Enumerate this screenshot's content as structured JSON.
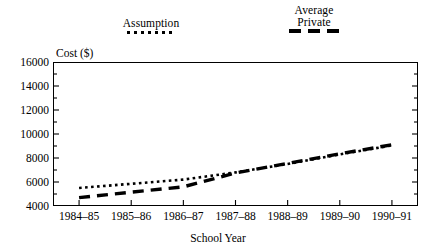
{
  "chart_data": {
    "type": "line",
    "title": "",
    "xlabel": "School Year",
    "ylabel": "Cost ($)",
    "categories": [
      "1984–85",
      "1985–86",
      "1986–87",
      "1987–88",
      "1988–89",
      "1989–90",
      "1990–91"
    ],
    "ylim": [
      4000,
      16000
    ],
    "ytick_labels": [
      "4000",
      "6000",
      "8000",
      "10000",
      "12000",
      "14000",
      "16000"
    ],
    "ytick_values": [
      4000,
      6000,
      8000,
      10000,
      12000,
      14000,
      16000
    ],
    "yminor_step": 1000,
    "grid": false,
    "legend_position": "above-plot",
    "series": [
      {
        "name": "Assumption",
        "style": "dotted",
        "values": [
          5500,
          5850,
          6200,
          6800,
          7500,
          8300,
          9050
        ]
      },
      {
        "name": "Average\nPrivate",
        "style": "dashed",
        "values": [
          4700,
          5150,
          5600,
          6750,
          7550,
          8350,
          9100
        ]
      }
    ]
  },
  "legend": {
    "assumption": {
      "label": "Assumption",
      "swatch": "dotted-line-swatch"
    },
    "average_private": {
      "label": "Average\nPrivate",
      "swatch": "dashed-line-swatch"
    }
  },
  "axes": {
    "y_title": "Cost ($)",
    "x_title": "School Year"
  }
}
